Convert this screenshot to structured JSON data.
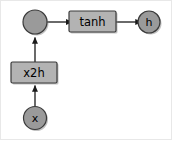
{
  "diagram": {
    "type": "flow-graph",
    "background_color": "#ffffff",
    "frame_color": "#e8e8e8",
    "colors": {
      "circle_fill": "#9a9a9a",
      "box_fill": "#b3b3b3",
      "stroke": "#333333",
      "arrow": "#1a1a1a",
      "label": "#000000",
      "shadow": "#8a8a8a"
    },
    "nodes": [
      {
        "id": "sum",
        "shape": "circle",
        "label": "",
        "cx": 35,
        "cy": 22,
        "r": 12
      },
      {
        "id": "tanh",
        "shape": "rect",
        "label": "tanh",
        "x": 69,
        "y": 11,
        "w": 47,
        "h": 21
      },
      {
        "id": "h",
        "shape": "circle",
        "label": "h",
        "cx": 149,
        "cy": 22,
        "r": 11
      },
      {
        "id": "x2h",
        "shape": "rect",
        "label": "x2h",
        "x": 11,
        "y": 62,
        "w": 46,
        "h": 21
      },
      {
        "id": "x",
        "shape": "circle",
        "label": "x",
        "cx": 35,
        "cy": 118,
        "r": 11.5
      }
    ],
    "edges": [
      {
        "id": "sum-to-tanh",
        "from": "sum",
        "to": "tanh",
        "direction": "right"
      },
      {
        "id": "tanh-to-h",
        "from": "tanh",
        "to": "h",
        "direction": "right"
      },
      {
        "id": "x2h-to-sum",
        "from": "x2h",
        "to": "sum",
        "direction": "up"
      },
      {
        "id": "x-to-x2h",
        "from": "x",
        "to": "x2h",
        "direction": "up"
      }
    ]
  }
}
